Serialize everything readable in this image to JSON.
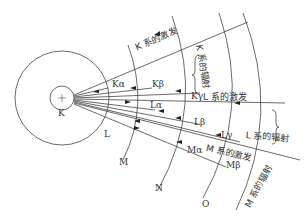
{
  "diagram": {
    "shells": [
      "K",
      "L",
      "M",
      "N",
      "O"
    ],
    "nucleus_symbol": "+",
    "transitions": [
      "Kα",
      "Kβ",
      "Kγ",
      "Lα",
      "Lβ",
      "Lγ",
      "Mα",
      "Mβ"
    ],
    "annotations": {
      "k_excitation": "K 系的激发",
      "k_radiation": "K 系的辐射",
      "l_excitation": "L 系的激发",
      "l_radiation": "L 系的辐射",
      "m_excitation": "M 系的激发",
      "m_radiation": "M 系的辐射"
    },
    "colors": {
      "line": "#444444",
      "text": "#333333",
      "background": "#ffffff"
    }
  }
}
